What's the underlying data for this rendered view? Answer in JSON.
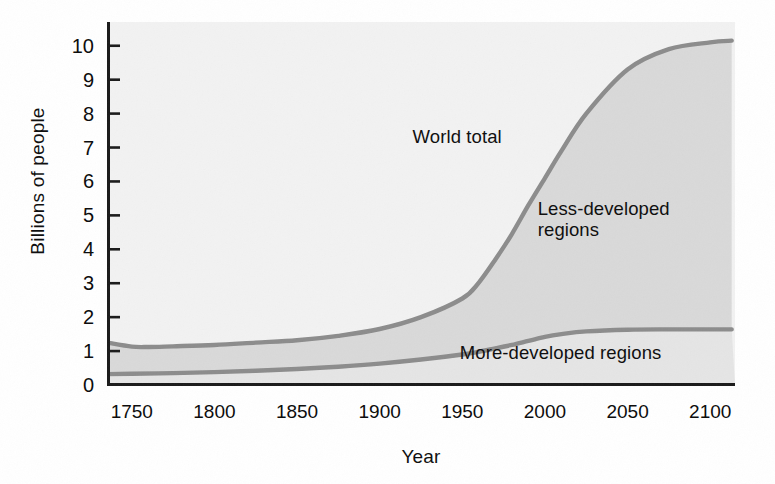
{
  "chart_data": {
    "type": "area",
    "title": "",
    "xlabel": "Year",
    "ylabel": "Billions of people",
    "xlim": [
      1735,
      2115
    ],
    "ylim": [
      0,
      10.7
    ],
    "grid": false,
    "legend_position": "inline-annotations",
    "x_ticks": [
      "1750",
      "1800",
      "1850",
      "1900",
      "1950",
      "2000",
      "2050",
      "2100"
    ],
    "x_tick_values": [
      1750,
      1800,
      1850,
      1900,
      1950,
      2000,
      2050,
      2100
    ],
    "y_ticks": [
      "0",
      "1",
      "2",
      "3",
      "4",
      "5",
      "6",
      "7",
      "8",
      "9",
      "10"
    ],
    "y_tick_values": [
      0,
      1,
      2,
      3,
      4,
      5,
      6,
      7,
      8,
      9,
      10
    ],
    "annotations": [
      {
        "text": "World total",
        "x": 1955,
        "y": 7.3
      },
      {
        "text": "Less-developed\nregions",
        "x": 2015,
        "y": 5.2
      },
      {
        "text": "More-developed regions",
        "x": 2015,
        "y": 0.95
      }
    ],
    "series": [
      {
        "name": "World total",
        "color": "#8c8c8c",
        "x": [
          1735,
          1750,
          1760,
          1775,
          1800,
          1825,
          1850,
          1875,
          1900,
          1925,
          1950,
          1960,
          1970,
          1980,
          1990,
          2000,
          2010,
          2025,
          2050,
          2075,
          2100,
          2113
        ],
        "values": [
          1.25,
          1.13,
          1.12,
          1.14,
          1.18,
          1.25,
          1.32,
          1.45,
          1.65,
          2.0,
          2.55,
          3.02,
          3.7,
          4.45,
          5.3,
          6.1,
          6.9,
          8.0,
          9.3,
          9.9,
          10.1,
          10.15
        ]
      },
      {
        "name": "More-developed regions",
        "color": "#8c8c8c",
        "x": [
          1735,
          1750,
          1775,
          1800,
          1825,
          1850,
          1875,
          1900,
          1925,
          1950,
          1960,
          1970,
          1980,
          1990,
          2000,
          2010,
          2025,
          2050,
          2075,
          2100,
          2113
        ],
        "values": [
          0.32,
          0.33,
          0.35,
          0.38,
          0.42,
          0.47,
          0.54,
          0.63,
          0.75,
          0.9,
          0.98,
          1.08,
          1.18,
          1.3,
          1.42,
          1.5,
          1.58,
          1.63,
          1.64,
          1.64,
          1.64
        ]
      }
    ],
    "bands": [
      {
        "name": "Less-developed regions",
        "between": [
          "More-developed regions",
          "World total"
        ],
        "fill": "#d9d9d9"
      },
      {
        "name": "More-developed regions",
        "between": [
          "baseline",
          "More-developed regions"
        ],
        "fill": "#e3e3e3"
      },
      {
        "name": "Above world total",
        "between": [
          "World total",
          "top"
        ],
        "fill": "#f2f2f2"
      }
    ],
    "colors": {
      "curve": "#8c8c8c",
      "axis": "#1a1a1a",
      "plot_background": "#eaeaea",
      "band_less_developed": "#d9d9d9",
      "band_more_developed": "#e5e5e5",
      "above_curve": "#f2f2f2",
      "text": "#101010",
      "page_background": "#ffffff"
    }
  }
}
